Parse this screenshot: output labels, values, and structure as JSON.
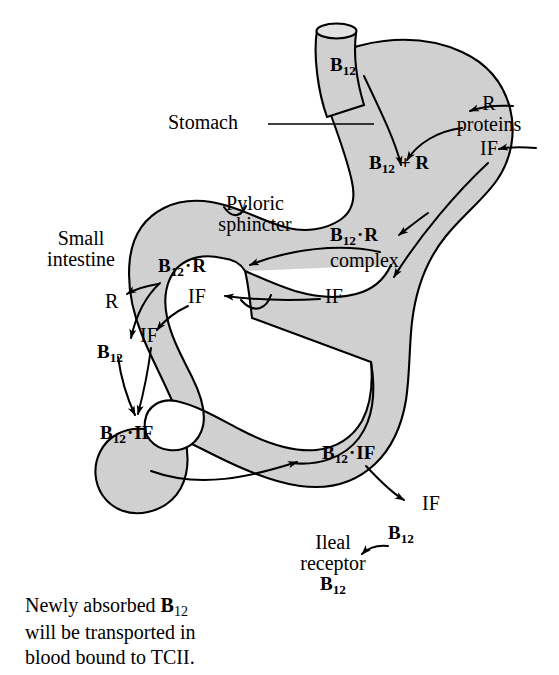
{
  "figure": {
    "background_color": "#ffffff",
    "organ_fill_color": "#d2d2d2",
    "outline_color": "#000000",
    "text_color": "#000000"
  },
  "anatomy_labels": {
    "stomach": "Stomach",
    "pyloric_sphincter_line1": "Pyloric",
    "pyloric_sphincter_line2": "sphincter",
    "small_intestine_line1": "Small",
    "small_intestine_line2": "intestine",
    "ileal_receptor_line1": "Ileal",
    "ileal_receptor_line2": "receptor",
    "ileal_receptor_line3": "B",
    "ileal_receptor_line3_sub": "12"
  },
  "molecules": {
    "b12_esophagus": {
      "base": "B",
      "sub": "12"
    },
    "r_proteins_line1": "R",
    "r_proteins_line2": "proteins",
    "if_stomach": "IF",
    "b12_plus_r": {
      "base": "B",
      "sub": "12",
      "tail": " + R"
    },
    "b12_dot_r_complex_line1": {
      "base": "B",
      "sub": "12",
      "dot": "·",
      "tail": "R"
    },
    "b12_dot_r_complex_line2": "complex",
    "if_antrum": "IF",
    "b12_dot_r_duodenum": {
      "base": "B",
      "sub": "12",
      "dot": "·",
      "tail": "R"
    },
    "if_duodenum_right": "IF",
    "r_released": "R",
    "if_duodenum_left": "IF",
    "b12_free": {
      "base": "B",
      "sub": "12"
    },
    "b12_dot_if_jejunum": {
      "base": "B",
      "sub": "12",
      "dot": "·",
      "tail": "IF"
    },
    "b12_dot_if_ileum": {
      "base": "B",
      "sub": "12",
      "dot": "·",
      "tail": "IF"
    },
    "if_released_ileum": "IF",
    "b12_absorbed": {
      "base": "B",
      "sub": "12"
    }
  },
  "caption": {
    "line1_pre": "Newly absorbed ",
    "line1_mol_base": "B",
    "line1_mol_sub": "12",
    "line2": "will be transported in",
    "line3": "blood bound to TCII."
  },
  "pathway_steps": [
    "Dietary B12 enters via esophagus into the stomach",
    "R proteins secreted from the stomach wall bind B12",
    "B12 + R forms the B12 · R complex",
    "Intrinsic factor (IF) is secreted from the stomach wall",
    "B12 · R complex passes the pyloric sphincter into the small intestine",
    "R protein is released from B12 · R in the duodenum",
    "Free B12 binds IF to form the B12 · IF complex",
    "B12 · IF travels along the small intestine to the ileum",
    "IF is released and B12 binds the ileal receptor for absorption"
  ]
}
